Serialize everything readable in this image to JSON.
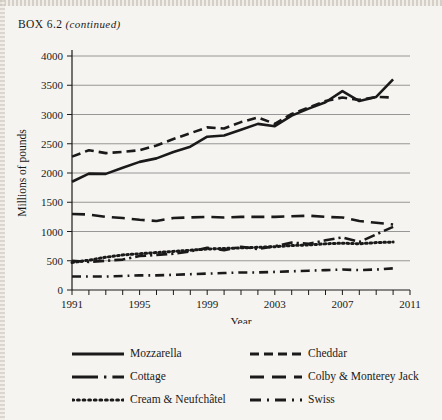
{
  "header": {
    "box_label": "BOX 6.2",
    "continued": "(continued)"
  },
  "chart_data": {
    "type": "line",
    "title": "",
    "xlabel": "Year",
    "ylabel": "Millions of pounds",
    "xlim": [
      1991,
      2011
    ],
    "ylim": [
      0,
      4000
    ],
    "ytick_step": 500,
    "yticks": [
      0,
      500,
      1000,
      1500,
      2000,
      2500,
      3000,
      3500,
      4000
    ],
    "ytick_labels": [
      "0",
      "500",
      "1000",
      "1500",
      "2000",
      "2500",
      "3000",
      "3500",
      "4000"
    ],
    "xticks": [
      1991,
      1992,
      1993,
      1994,
      1995,
      1996,
      1997,
      1998,
      1999,
      2000,
      2001,
      2002,
      2003,
      2004,
      2005,
      2006,
      2007,
      2008,
      2009,
      2010,
      2011
    ],
    "xtick_labels_shown": [
      "1991",
      "1995",
      "1999",
      "2003",
      "2007",
      "2011"
    ],
    "xtick_labels_values": [
      1991,
      1995,
      1999,
      2003,
      2007,
      2011
    ],
    "grid": "horizontal",
    "legend_position": "bottom",
    "x": [
      1991,
      1992,
      1993,
      1994,
      1995,
      1996,
      1997,
      1998,
      1999,
      2000,
      2001,
      2002,
      2003,
      2004,
      2005,
      2006,
      2007,
      2008,
      2009,
      2010
    ],
    "series": [
      {
        "name": "Mozzarella",
        "style": "solid",
        "values": [
          1850,
          1990,
          1985,
          2090,
          2190,
          2250,
          2360,
          2450,
          2620,
          2640,
          2740,
          2840,
          2800,
          2980,
          3100,
          3210,
          3400,
          3230,
          3300,
          3600
        ]
      },
      {
        "name": "Cheddar",
        "style": "dashed",
        "values": [
          2280,
          2390,
          2340,
          2360,
          2390,
          2470,
          2580,
          2680,
          2780,
          2760,
          2870,
          2950,
          2840,
          3010,
          3120,
          3230,
          3290,
          3250,
          3300,
          3290
        ]
      },
      {
        "name": "Cottage",
        "style": "dash-dot",
        "values": [
          500,
          480,
          500,
          520,
          580,
          600,
          620,
          660,
          720,
          680,
          740,
          700,
          750,
          810,
          790,
          850,
          900,
          820,
          950,
          1080
        ]
      },
      {
        "name": "Colby & Monterey Jack",
        "style": "long-dash",
        "values": [
          1300,
          1290,
          1250,
          1230,
          1200,
          1180,
          1230,
          1240,
          1250,
          1240,
          1250,
          1250,
          1250,
          1260,
          1270,
          1250,
          1240,
          1180,
          1150,
          1120
        ]
      },
      {
        "name": "Cream & Neufchâtel",
        "style": "dotted",
        "values": [
          470,
          510,
          560,
          600,
          620,
          640,
          660,
          680,
          700,
          710,
          720,
          730,
          740,
          760,
          770,
          790,
          800,
          790,
          810,
          820
        ]
      },
      {
        "name": "Swiss",
        "style": "dash-dot-short",
        "values": [
          230,
          230,
          230,
          240,
          250,
          250,
          260,
          270,
          280,
          290,
          300,
          300,
          310,
          320,
          330,
          340,
          350,
          340,
          350,
          370
        ]
      }
    ]
  },
  "legend": {
    "items": [
      {
        "label": "Mozzarella",
        "style": "solid",
        "col": 0,
        "row": 0
      },
      {
        "label": "Cheddar",
        "style": "dashed",
        "col": 1,
        "row": 0
      },
      {
        "label": "Cottage",
        "style": "dash-dot",
        "col": 0,
        "row": 1
      },
      {
        "label": "Colby & Monterey Jack",
        "style": "long-dash",
        "col": 1,
        "row": 1
      },
      {
        "label": "Cream & Neufchâtel",
        "style": "dotted",
        "col": 0,
        "row": 2
      },
      {
        "label": "Swiss",
        "style": "dash-dot-short",
        "col": 1,
        "row": 2
      }
    ]
  },
  "colors": {
    "ink": "#1a1a1a",
    "grid": "#8c8c8c",
    "paper": "#f6f4f0"
  }
}
